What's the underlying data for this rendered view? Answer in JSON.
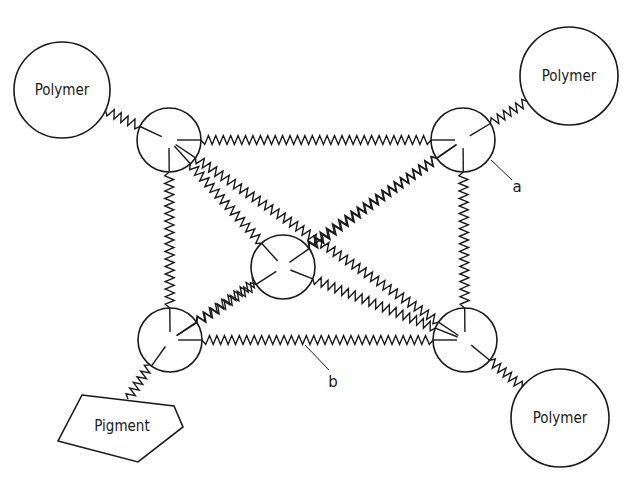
{
  "diagram": {
    "type": "network-crosslink-schematic",
    "colors": {
      "stroke": "#1a1a1a",
      "background": "#ffffff"
    },
    "polymers": [
      {
        "id": "polymer-top-left",
        "label": "Polymer",
        "cx": 62,
        "cy": 90,
        "r": 48
      },
      {
        "id": "polymer-top-right",
        "label": "Polymer",
        "cx": 569,
        "cy": 76,
        "r": 49
      },
      {
        "id": "polymer-bottom-right",
        "label": "Polymer",
        "cx": 560,
        "cy": 418,
        "r": 49
      }
    ],
    "pigment": {
      "label": "Pigment",
      "points": "82,395 174,406 183,427 138,462 58,441",
      "label_x": 122,
      "label_y": 431
    },
    "nodes": [
      {
        "id": "node-top-left",
        "cx": 169,
        "cy": 140,
        "r": 32
      },
      {
        "id": "node-top-right",
        "cx": 463,
        "cy": 140,
        "r": 32
      },
      {
        "id": "node-center",
        "cx": 283,
        "cy": 267,
        "r": 32
      },
      {
        "id": "node-bottom-left",
        "cx": 170,
        "cy": 340,
        "r": 32
      },
      {
        "id": "node-bottom-right",
        "cx": 465,
        "cy": 340,
        "r": 32
      }
    ],
    "annotations": [
      {
        "id": "annotation-a",
        "label": "a",
        "x": 517,
        "y": 192,
        "line": [
          491,
          160,
          512,
          180
        ]
      },
      {
        "id": "annotation-b",
        "label": "b",
        "x": 333,
        "y": 387,
        "line": [
          305,
          345,
          329,
          370
        ]
      }
    ]
  }
}
